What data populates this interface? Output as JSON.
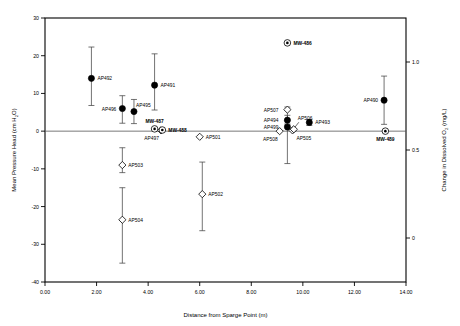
{
  "chart_data": {
    "type": "scatter",
    "title": "",
    "xlabel": "Distance from Sparge Point (m)",
    "ylabel": "Mean Pressure Head (cm H2O)",
    "ylabel_right": "Change in Dissolved O2 (mg/L)",
    "xlim": [
      0,
      14
    ],
    "ylim": [
      -40,
      30
    ],
    "ylim_right": [
      -0.25,
      1.25
    ],
    "xticks": [
      "0.00",
      "2.00",
      "4.00",
      "6.00",
      "8.00",
      "10.00",
      "12.00",
      "14.00"
    ],
    "xtick_values": [
      0,
      2,
      4,
      6,
      8,
      10,
      12,
      14
    ],
    "yticks": [
      "30",
      "20",
      "10",
      "0",
      "-10",
      "-20",
      "-30",
      "-40"
    ],
    "ytick_values": [
      30,
      20,
      10,
      0,
      -10,
      -20,
      -30,
      -40
    ],
    "yticks_right": [
      "1.0",
      "0.5",
      "0"
    ],
    "ytick_right_values": [
      1.0,
      0.5,
      0
    ],
    "grid": false,
    "legend": "none",
    "zero_reference_line": 0,
    "series": [
      {
        "name": "Mean Pressure Head - filled circle",
        "marker": "filled-circle",
        "axis": "left",
        "points": [
          {
            "label": "AP492",
            "x": 1.8,
            "y": 14.0,
            "err_low": 6.8,
            "err_high": 22.3,
            "label_pos": "right"
          },
          {
            "label": "AP496",
            "x": 3.0,
            "y": 6.0,
            "err_low": 2.1,
            "err_high": 9.4,
            "label_pos": "left"
          },
          {
            "label": "AP495",
            "x": 3.45,
            "y": 5.2,
            "err_low": 2.0,
            "err_high": 8.4,
            "label_pos": "upright"
          },
          {
            "label": "AP491",
            "x": 4.25,
            "y": 12.2,
            "err_low": 5.6,
            "err_high": 20.5,
            "label_pos": "right"
          },
          {
            "label": "AP494",
            "x": 9.4,
            "y": 2.9,
            "err_low": 1.6,
            "err_high": 4.2,
            "label_pos": "farleft"
          },
          {
            "label": "AP499",
            "x": 9.4,
            "y": 1.1,
            "err_low": -8.6,
            "err_high": 1.9,
            "label_pos": "farleft"
          },
          {
            "label": "AP493",
            "x": 10.25,
            "y": 2.3,
            "err_low": 1.5,
            "err_high": 3.1,
            "label_pos": "right"
          },
          {
            "label": "AP490",
            "x": 13.15,
            "y": 8.2,
            "err_low": 1.8,
            "err_high": 14.6,
            "label_pos": "left"
          }
        ]
      },
      {
        "name": "Mean Pressure Head - open diamond",
        "marker": "open-diamond",
        "axis": "left",
        "points": [
          {
            "label": "AP497",
            "x": 4.5,
            "y": 0.2,
            "err_low": null,
            "err_high": null,
            "label_pos": "belowleft"
          },
          {
            "label": "AP501",
            "x": 6.0,
            "y": -1.5,
            "err_low": null,
            "err_high": null,
            "label_pos": "right"
          },
          {
            "label": "AP503",
            "x": 3.0,
            "y": -9.0,
            "err_low": -11.0,
            "err_high": -4.4,
            "label_pos": "right"
          },
          {
            "label": "AP502",
            "x": 6.1,
            "y": -16.7,
            "err_low": -26.4,
            "err_high": -8.2,
            "label_pos": "right"
          },
          {
            "label": "AP504",
            "x": 3.0,
            "y": -23.5,
            "err_low": -35.0,
            "err_high": -15.0,
            "label_pos": "right"
          },
          {
            "label": "AP507",
            "x": 9.4,
            "y": 5.7,
            "err_low": 3.0,
            "err_high": 6.4,
            "label_pos": "farleft"
          },
          {
            "label": "AP508",
            "x": 9.1,
            "y": 0.0,
            "err_low": null,
            "err_high": null,
            "label_pos": "belowleft"
          },
          {
            "label": "AP505",
            "x": 9.6,
            "y": 0.2,
            "err_low": null,
            "err_high": null,
            "label_pos": "belowright"
          },
          {
            "label": "AP506",
            "x": 9.65,
            "y": 0.5,
            "err_low": null,
            "err_high": null,
            "label_pos": "leaderup"
          }
        ]
      },
      {
        "name": "Change in Dissolved O2 - monitoring wells",
        "marker": "circle-dot",
        "axis": "right",
        "points": [
          {
            "label": "MW-487",
            "x": 4.25,
            "y": 0.6,
            "label_pos": "above"
          },
          {
            "label": "MW-488",
            "x": 4.55,
            "y": 0.3,
            "label_pos": "right"
          },
          {
            "label": "MW-486",
            "x": 9.4,
            "y": 23.4,
            "label_pos": "right"
          },
          {
            "label": "MW-489",
            "x": 13.2,
            "y": 0.0,
            "label_pos": "below"
          }
        ]
      }
    ]
  }
}
